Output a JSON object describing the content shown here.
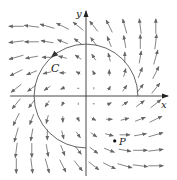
{
  "figure": {
    "labels": {
      "x_axis": "x",
      "y_axis": "y",
      "curve": "C",
      "point": "P"
    },
    "colors": {
      "axis": "#333333",
      "curve": "#555555",
      "arrow": "#666666",
      "point": "#111111"
    }
  },
  "chart_data": {
    "type": "vector_field",
    "title": "",
    "field": "F(x, y) = (x - y, x + y)",
    "xlabel": "x",
    "ylabel": "y",
    "grid_on": false,
    "grid": {
      "x": [
        -4.5,
        -3.5,
        -2.5,
        -1.5,
        -0.5,
        0.5,
        1.5,
        2.5,
        3.5,
        4.5
      ],
      "y": [
        -4.5,
        -3.5,
        -2.5,
        -1.5,
        -0.5,
        0.5,
        1.5,
        2.5,
        3.5,
        4.5
      ]
    },
    "curve": {
      "name": "C",
      "shape": "arc of circle centered at origin",
      "radius": 3.35,
      "start_angle_deg": 0,
      "end_angle_deg": 270,
      "direction": "counterclockwise",
      "arrow_at_angle_deg": 130
    },
    "point": {
      "name": "P",
      "x": 1.85,
      "y": -2.9
    },
    "pixel_mapping": {
      "origin_px": [
        86,
        96
      ],
      "unit_px": 15.5
    }
  }
}
